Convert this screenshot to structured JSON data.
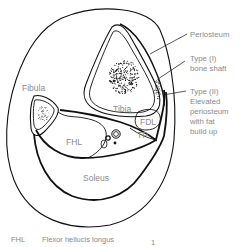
{
  "figure": {
    "structures": {
      "tibia": "Tibia",
      "fibula": "Fibula",
      "fhl": "FHL",
      "fdl": "FDL",
      "tp": "TP",
      "soleus": "Soleus"
    },
    "annotations": [
      {
        "id": "periosteum",
        "lines": [
          "Periosteum"
        ]
      },
      {
        "id": "type1",
        "lines": [
          "Type (I)",
          "bone shaft"
        ]
      },
      {
        "id": "type2",
        "lines": [
          "Type (II)",
          "Elevated",
          "periosteum",
          "with fat",
          "build up"
        ]
      }
    ],
    "legend": {
      "abbr": "FHL",
      "text": "Flexor hellucis longus",
      "marker": "1"
    }
  }
}
